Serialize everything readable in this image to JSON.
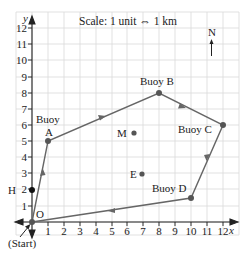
{
  "diagram": {
    "scale_text": "Scale: 1 unit ⇔ 1 km",
    "north_label": "N",
    "axes": {
      "x_label": "x",
      "y_label": "y",
      "x_ticks": [
        "1",
        "2",
        "3",
        "4",
        "5",
        "6",
        "7",
        "8",
        "9",
        "10",
        "11",
        "12"
      ],
      "y_ticks": [
        "1",
        "2",
        "3",
        "4",
        "5",
        "6",
        "7",
        "8",
        "9",
        "10",
        "11",
        "12"
      ]
    },
    "start_label": "(Start)",
    "origin_label": "O",
    "points": {
      "A": {
        "label_line1": "Buoy",
        "label_line2": "A",
        "x": 1,
        "y": 5
      },
      "B": {
        "label": "Buoy B",
        "x": 8,
        "y": 8
      },
      "C": {
        "label": "Buoy C",
        "x": 12,
        "y": 6
      },
      "D": {
        "label": "Buoy D",
        "x": 10,
        "y": 1.5
      },
      "H": {
        "label": "H",
        "x": 0,
        "y": 2
      },
      "M": {
        "label": "M",
        "x": 6.5,
        "y": 5.5
      },
      "E": {
        "label": "E",
        "x": 7,
        "y": 3
      }
    },
    "route": [
      "O",
      "A",
      "B",
      "C",
      "D",
      "O"
    ],
    "colors": {
      "grid": "#d9d9d9",
      "route": "#666666",
      "axis": "#222222",
      "point": "#555555"
    }
  }
}
